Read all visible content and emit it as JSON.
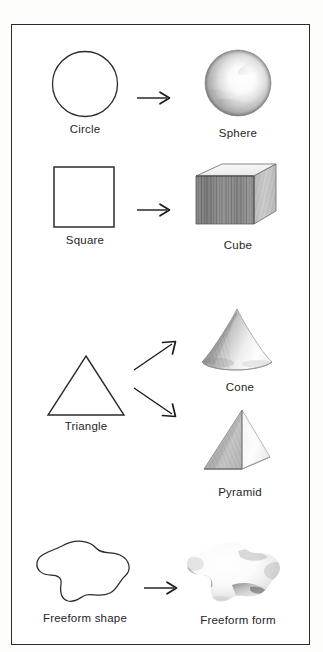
{
  "page": {
    "kind": "instructional-diagram",
    "border_color": "#2b2b2b",
    "background_color": "#ffffff",
    "ink_color": "#262626"
  },
  "rows": [
    {
      "id": "circle-sphere",
      "shape": {
        "name": "Circle",
        "type": "circle",
        "style": "outline"
      },
      "arrow": {
        "direction": "right",
        "glyph": "arrow-right"
      },
      "form": {
        "name": "Sphere",
        "type": "sphere",
        "style": "pencil-shaded"
      }
    },
    {
      "id": "square-cube",
      "shape": {
        "name": "Square",
        "type": "square",
        "style": "outline"
      },
      "arrow": {
        "direction": "right",
        "glyph": "arrow-right"
      },
      "form": {
        "name": "Cube",
        "type": "cube",
        "style": "pencil-shaded"
      }
    },
    {
      "id": "triangle-cone-pyramid",
      "shape": {
        "name": "Triangle",
        "type": "triangle",
        "style": "outline"
      },
      "arrows": [
        {
          "direction": "up-right",
          "glyph": "arrow-up-right"
        },
        {
          "direction": "down-right",
          "glyph": "arrow-down-right"
        }
      ],
      "forms": [
        {
          "name": "Cone",
          "type": "cone",
          "style": "pencil-shaded"
        },
        {
          "name": "Pyramid",
          "type": "pyramid",
          "style": "pencil-shaded"
        }
      ]
    },
    {
      "id": "freeform",
      "shape": {
        "name": "Freeform shape",
        "type": "blob",
        "style": "outline"
      },
      "arrow": {
        "direction": "right",
        "glyph": "arrow-right"
      },
      "form": {
        "name": "Freeform form",
        "type": "blob",
        "style": "pencil-shaded"
      }
    }
  ],
  "labels": {
    "circle": "Circle",
    "sphere": "Sphere",
    "square": "Square",
    "cube": "Cube",
    "triangle": "Triangle",
    "cone": "Cone",
    "pyramid": "Pyramid",
    "freeform_shape": "Freeform shape",
    "freeform_form": "Freeform form"
  }
}
